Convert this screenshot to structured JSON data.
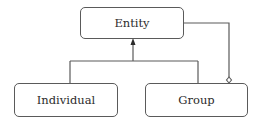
{
  "diagram": {
    "type": "uml-class",
    "nodes": [
      {
        "id": "entity",
        "label": "Entity"
      },
      {
        "id": "individual",
        "label": "Individual"
      },
      {
        "id": "group",
        "label": "Group"
      }
    ],
    "edges": [
      {
        "from": "individual",
        "to": "entity",
        "kind": "generalization",
        "arrow": "filled-triangle"
      },
      {
        "from": "group",
        "to": "entity",
        "kind": "generalization",
        "arrow": "filled-triangle"
      },
      {
        "from": "entity",
        "to": "group",
        "kind": "aggregation",
        "arrow": "hollow-diamond-at-group"
      }
    ],
    "colors": {
      "stroke": "#5a5a5a",
      "text": "#2b2b2b",
      "background": "#ffffff"
    }
  }
}
